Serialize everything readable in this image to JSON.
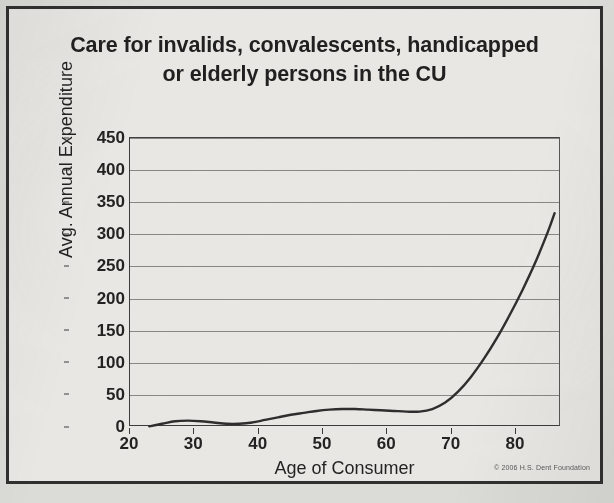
{
  "figure": {
    "title_line1": "Care for invalids, convalescents, handicapped",
    "title_line2": "or elderly persons in the CU",
    "copyright": "© 2006 H.S. Dent Foundation",
    "frame_color": "#2e2e2e",
    "line_color": "#2b2b2b",
    "grid_color": "#6a6a6a",
    "background_color": "#ecebe7"
  },
  "chart_data": {
    "type": "line",
    "title": "Care for invalids, convalescents, handicapped or elderly persons in the CU",
    "xlabel": "Age of Consumer",
    "ylabel": "Avg. Annual Expenditure",
    "xlim": [
      20,
      87
    ],
    "ylim": [
      0,
      450
    ],
    "xticks": [
      20,
      30,
      40,
      50,
      60,
      70,
      80
    ],
    "yticks": [
      0,
      50,
      100,
      150,
      200,
      250,
      300,
      350,
      400,
      450
    ],
    "grid": "horizontal",
    "legend": "none",
    "series": [
      {
        "name": "Avg. Annual Expenditure",
        "x": [
          23,
          25,
          27,
          29,
          31,
          33,
          35,
          37,
          39,
          41,
          43,
          45,
          47,
          49,
          51,
          53,
          55,
          57,
          59,
          61,
          63,
          65,
          67,
          69,
          71,
          73,
          75,
          77,
          79,
          81,
          83,
          85,
          86
        ],
        "values": [
          1,
          5,
          9,
          10,
          9,
          7,
          5,
          5,
          7,
          11,
          15,
          19,
          22,
          25,
          27,
          28,
          28,
          27,
          26,
          25,
          24,
          24,
          28,
          38,
          55,
          78,
          106,
          138,
          174,
          213,
          256,
          305,
          333
        ]
      }
    ]
  },
  "axes": {
    "y_tick_labels": [
      "450",
      "400",
      "350",
      "300",
      "250",
      "200",
      "150",
      "100",
      "50",
      "0"
    ],
    "x_tick_labels": [
      "20",
      "30",
      "40",
      "50",
      "60",
      "70",
      "80"
    ]
  }
}
